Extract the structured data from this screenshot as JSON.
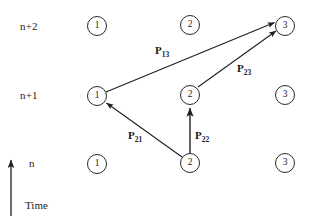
{
  "diagram": {
    "background_color": "#ffffff",
    "stroke_color": "#2a2a2a",
    "text_color": "#1b1b1b",
    "time_axis": {
      "label": "Time",
      "direction": "up",
      "arrow_icon": "up-arrow-icon"
    },
    "rows": [
      {
        "id": "row-n-plus-2",
        "label": "n+2"
      },
      {
        "id": "row-n-plus-1",
        "label": "n+1"
      },
      {
        "id": "row-n",
        "label": "n"
      }
    ],
    "nodes": [
      {
        "id": "node-n2-1",
        "label": "1",
        "row": "n+2",
        "x": 97,
        "y": 26
      },
      {
        "id": "node-n2-2",
        "label": "2",
        "row": "n+2",
        "x": 190,
        "y": 25
      },
      {
        "id": "node-n2-3",
        "label": "3",
        "row": "n+2",
        "x": 285,
        "y": 26
      },
      {
        "id": "node-n1-1",
        "label": "1",
        "row": "n+1",
        "x": 97,
        "y": 96
      },
      {
        "id": "node-n1-2",
        "label": "2",
        "row": "n+1",
        "x": 190,
        "y": 95
      },
      {
        "id": "node-n1-3",
        "label": "3",
        "row": "n+1",
        "x": 285,
        "y": 95
      },
      {
        "id": "node-n-1",
        "label": "1",
        "row": "n",
        "x": 97,
        "y": 164
      },
      {
        "id": "node-n-2",
        "label": "2",
        "row": "n",
        "x": 190,
        "y": 163
      },
      {
        "id": "node-n-3",
        "label": "3",
        "row": "n",
        "x": 285,
        "y": 163
      }
    ],
    "edges": [
      {
        "id": "edge-p13",
        "label": "P",
        "sub": "13",
        "from": "node-n1-1",
        "to": "node-n2-3",
        "label_x": 155,
        "label_y": 44
      },
      {
        "id": "edge-p23",
        "label": "P",
        "sub": "23",
        "from": "node-n1-2",
        "to": "node-n2-3",
        "label_x": 237,
        "label_y": 62
      },
      {
        "id": "edge-p21",
        "label": "P",
        "sub": "21",
        "from": "node-n-2",
        "to": "node-n1-1",
        "label_x": 128,
        "label_y": 129
      },
      {
        "id": "edge-p22",
        "label": "P",
        "sub": "22",
        "from": "node-n-2",
        "to": "node-n1-2",
        "label_x": 195,
        "label_y": 129
      }
    ]
  }
}
